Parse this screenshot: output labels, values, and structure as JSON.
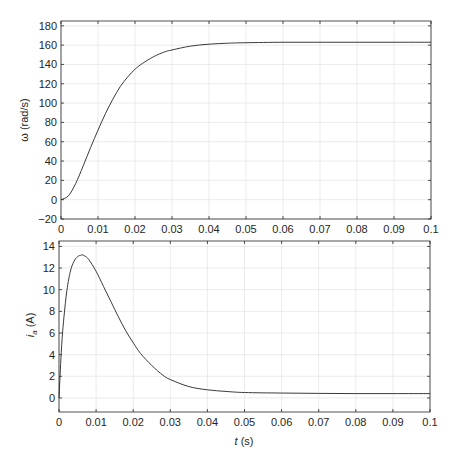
{
  "chart_data": [
    {
      "type": "line",
      "title": "",
      "xlabel": "",
      "ylabel": "ω (rad/s)",
      "xlim": [
        0,
        0.1
      ],
      "ylim": [
        -20,
        185
      ],
      "grid": true,
      "xticks": [
        0,
        0.01,
        0.02,
        0.03,
        0.04,
        0.05,
        0.06,
        0.07,
        0.08,
        0.09,
        0.1
      ],
      "xtick_labels": [
        "0",
        "0.01",
        "0.02",
        "0.03",
        "0.04",
        "0.05",
        "0.06",
        "0.07",
        "0.08",
        "0.09",
        "0.1"
      ],
      "yticks": [
        -20,
        0,
        20,
        40,
        60,
        80,
        100,
        120,
        140,
        160,
        180
      ],
      "ytick_labels": [
        "−20",
        "0",
        "20",
        "40",
        "60",
        "80",
        "100",
        "120",
        "140",
        "160",
        "180"
      ],
      "series": [
        {
          "name": "omega",
          "x": [
            0,
            0.002,
            0.004,
            0.006,
            0.008,
            0.01,
            0.012,
            0.014,
            0.016,
            0.018,
            0.02,
            0.022,
            0.025,
            0.028,
            0.03,
            0.035,
            0.04,
            0.045,
            0.05,
            0.06,
            0.07,
            0.08,
            0.09,
            0.1
          ],
          "values": [
            0,
            4,
            17,
            35,
            54,
            72,
            89,
            104,
            117,
            127,
            135,
            141,
            148,
            153,
            155,
            159,
            161,
            162,
            162.5,
            163,
            163,
            163,
            163,
            163
          ]
        }
      ]
    },
    {
      "type": "line",
      "title": "",
      "xlabel": "t (s)",
      "ylabel": "i_a (A)",
      "xlim": [
        0,
        0.1
      ],
      "ylim": [
        -1.3,
        14.5
      ],
      "grid": true,
      "xticks": [
        0,
        0.01,
        0.02,
        0.03,
        0.04,
        0.05,
        0.06,
        0.07,
        0.08,
        0.09,
        0.1
      ],
      "xtick_labels": [
        "0",
        "0.01",
        "0.02",
        "0.03",
        "0.04",
        "0.05",
        "0.06",
        "0.07",
        "0.08",
        "0.09",
        "0.1"
      ],
      "yticks": [
        0,
        2,
        4,
        6,
        8,
        10,
        12,
        14
      ],
      "ytick_labels": [
        "0",
        "2",
        "4",
        "6",
        "8",
        "10",
        "12",
        "14"
      ],
      "series": [
        {
          "name": "armature current",
          "x": [
            0,
            0.0005,
            0.001,
            0.002,
            0.003,
            0.004,
            0.005,
            0.006,
            0.0065,
            0.007,
            0.008,
            0.01,
            0.012,
            0.014,
            0.016,
            0.018,
            0.02,
            0.022,
            0.025,
            0.028,
            0.03,
            0.035,
            0.04,
            0.045,
            0.05,
            0.06,
            0.07,
            0.08,
            0.09,
            0.1
          ],
          "values": [
            0,
            3.5,
            6.2,
            9.6,
            11.6,
            12.6,
            13.05,
            13.2,
            13.2,
            13.1,
            12.8,
            11.7,
            10.3,
            8.9,
            7.5,
            6.2,
            5.1,
            4.1,
            3.0,
            2.1,
            1.7,
            1.05,
            0.75,
            0.6,
            0.5,
            0.45,
            0.42,
            0.4,
            0.4,
            0.4
          ]
        }
      ]
    }
  ],
  "labels": {
    "top_ylabel": "ω (rad/s)",
    "bottom_ylabel_main": "i",
    "bottom_ylabel_sub": "a",
    "bottom_ylabel_unit": " (A)",
    "xlabel_var": "t",
    "xlabel_unit": " (s)"
  },
  "colors": {
    "line": "#3a3a3a",
    "grid": "#e6e6e6",
    "axis": "#262626",
    "background": "#ffffff"
  }
}
